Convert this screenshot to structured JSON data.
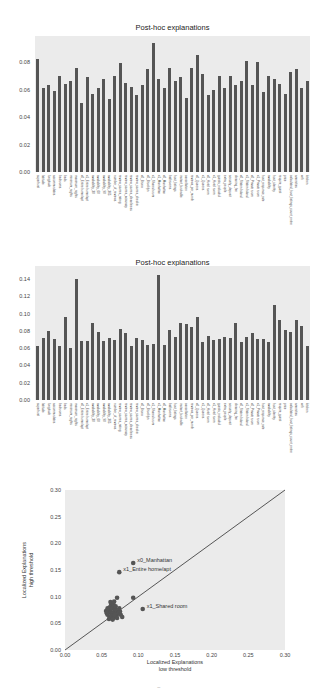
{
  "chart_data": [
    {
      "type": "bar",
      "title": "Post-hoc explanations",
      "xlabel": "",
      "ylabel": "",
      "ylim": [
        0,
        0.099
      ],
      "yticks": [
        "0.00",
        "0.02",
        "0.04",
        "0.06",
        "0.08"
      ],
      "grid": false,
      "categories": [
        "superhost",
        "latitude",
        "longitude",
        "accommodates",
        "bedrooms",
        "beds",
        "minimum_nights",
        "maximum_nights",
        "x0_Entire home/apt",
        "x1_Entire home/apt",
        "availability_30",
        "availability_60",
        "availability_90",
        "availability_365",
        "number_of_reviews",
        "review_scores_rating",
        "review_scores_accuracy",
        "review_scores_cleanliness",
        "review_scores_checkin",
        "x0_Bronx",
        "x0_Brooklyn",
        "x1_Shared room",
        "x1_Manhattan",
        "x0_Manhattan",
        "bathrooms",
        "host_listings",
        "instant_bookable",
        "cancellation",
        "reviews_per_month",
        "x0_Queens",
        "x1_Queens",
        "x0_Hotel room",
        "x1_Hotel room",
        "guests_included",
        "extra_people",
        "security_deposit",
        "cleaning_fee",
        "x0_Staten Island",
        "x1_Staten Island",
        "x0_Private room",
        "x1_Private room",
        "host_response_rate",
        "availability",
        "host_identity",
        "require_guest",
        "price",
        "calculated_host_listings_count_entire",
        "amenities",
        "wifi",
        "kitchen"
      ],
      "values": [
        0.082,
        0.061,
        0.063,
        0.059,
        0.07,
        0.064,
        0.066,
        0.076,
        0.05,
        0.069,
        0.057,
        0.061,
        0.068,
        0.053,
        0.07,
        0.079,
        0.065,
        0.062,
        0.056,
        0.063,
        0.075,
        0.094,
        0.068,
        0.061,
        0.076,
        0.066,
        0.069,
        0.054,
        0.076,
        0.085,
        0.071,
        0.056,
        0.06,
        0.07,
        0.061,
        0.07,
        0.063,
        0.066,
        0.081,
        0.063,
        0.08,
        0.058,
        0.07,
        0.068,
        0.064,
        0.057,
        0.073,
        0.075,
        0.061,
        0.066
      ]
    },
    {
      "type": "bar",
      "title": "Post-hoc explanations",
      "xlabel": "",
      "ylabel": "",
      "ylim": [
        0,
        0.155
      ],
      "yticks": [
        "0.00",
        "0.02",
        "0.04",
        "0.06",
        "0.08",
        "0.10",
        "0.12",
        "0.14"
      ],
      "grid": false,
      "categories": [
        "superhost",
        "latitude",
        "longitude",
        "accommodates",
        "bedrooms",
        "beds",
        "minimum_nights",
        "maximum_nights",
        "x0_Entire home/apt",
        "x1_Entire home/apt",
        "availability_30",
        "availability_60",
        "availability_90",
        "availability_365",
        "number_of_reviews",
        "review_scores_rating",
        "review_scores_accuracy",
        "review_scores_cleanliness",
        "review_scores_checkin",
        "x0_Bronx",
        "x0_Brooklyn",
        "x1_Shared room",
        "x1_Manhattan",
        "x0_Manhattan",
        "bathrooms",
        "host_listings",
        "instant_bookable",
        "cancellation",
        "reviews_per_month",
        "x0_Queens",
        "x1_Queens",
        "x0_Hotel room",
        "x1_Hotel room",
        "guests_included",
        "extra_people",
        "security_deposit",
        "cleaning_fee",
        "x0_Staten Island",
        "x1_Staten Island",
        "x0_Private room",
        "x1_Private room",
        "host_response_rate",
        "availability",
        "host_identity",
        "require_guest",
        "price",
        "calculated_host_listings_count_entire",
        "amenities",
        "wifi",
        "kitchen"
      ],
      "values": [
        0.063,
        0.072,
        0.08,
        0.071,
        0.063,
        0.096,
        0.06,
        0.14,
        0.068,
        0.068,
        0.089,
        0.079,
        0.068,
        0.072,
        0.069,
        0.082,
        0.078,
        0.062,
        0.072,
        0.069,
        0.064,
        0.065,
        0.145,
        0.064,
        0.081,
        0.073,
        0.089,
        0.088,
        0.084,
        0.096,
        0.067,
        0.074,
        0.069,
        0.07,
        0.073,
        0.072,
        0.089,
        0.067,
        0.073,
        0.078,
        0.071,
        0.071,
        0.067,
        0.11,
        0.092,
        0.081,
        0.079,
        0.092,
        0.086,
        0.063
      ]
    },
    {
      "type": "scatter",
      "title": "",
      "xlabel": "Localized Explanations\nlow threshold",
      "ylabel": "Localized Explanations\nhigh threshold",
      "xlabel_lines": [
        "Localized Explanations",
        "low threshold"
      ],
      "ylabel_lines": [
        "Localized Explanations",
        "high threshold"
      ],
      "xlim": [
        0,
        0.3
      ],
      "ylim": [
        0,
        0.3
      ],
      "xticks": [
        "0.00",
        "0.05",
        "0.10",
        "0.15",
        "0.20",
        "0.25",
        "0.30"
      ],
      "yticks": [
        "0.00",
        "0.05",
        "0.10",
        "0.15",
        "0.20",
        "0.25",
        "0.30"
      ],
      "reference_line": "y = x",
      "grid": false,
      "annotations": [
        {
          "label": "x0_Manhattan",
          "x": 0.093,
          "y": 0.163
        },
        {
          "label": "x1_Entire home/apt",
          "x": 0.074,
          "y": 0.146
        },
        {
          "label": "x1_Shared room",
          "x": 0.106,
          "y": 0.077
        }
      ],
      "points": [
        [
          0.093,
          0.163
        ],
        [
          0.074,
          0.146
        ],
        [
          0.106,
          0.077
        ],
        [
          0.071,
          0.098
        ],
        [
          0.093,
          0.098
        ],
        [
          0.06,
          0.075
        ],
        [
          0.062,
          0.072
        ],
        [
          0.064,
          0.068
        ],
        [
          0.066,
          0.07
        ],
        [
          0.058,
          0.066
        ],
        [
          0.061,
          0.08
        ],
        [
          0.063,
          0.085
        ],
        [
          0.065,
          0.078
        ],
        [
          0.068,
          0.074
        ],
        [
          0.07,
          0.072
        ],
        [
          0.059,
          0.071
        ],
        [
          0.057,
          0.069
        ],
        [
          0.067,
          0.082
        ],
        [
          0.069,
          0.076
        ],
        [
          0.072,
          0.068
        ],
        [
          0.063,
          0.064
        ],
        [
          0.061,
          0.062
        ],
        [
          0.066,
          0.06
        ],
        [
          0.07,
          0.064
        ],
        [
          0.073,
          0.07
        ],
        [
          0.076,
          0.066
        ],
        [
          0.075,
          0.072
        ],
        [
          0.064,
          0.088
        ],
        [
          0.062,
          0.09
        ],
        [
          0.066,
          0.086
        ],
        [
          0.068,
          0.066
        ],
        [
          0.06,
          0.058
        ],
        [
          0.065,
          0.057
        ],
        [
          0.071,
          0.06
        ],
        [
          0.078,
          0.062
        ],
        [
          0.074,
          0.078
        ],
        [
          0.069,
          0.082
        ],
        [
          0.067,
          0.091
        ],
        [
          0.056,
          0.073
        ],
        [
          0.058,
          0.078
        ]
      ]
    }
  ],
  "footer": {
    "page_mark": "~"
  }
}
